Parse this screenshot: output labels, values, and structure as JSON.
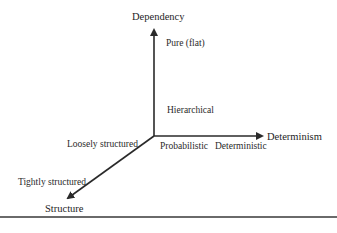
{
  "diagram": {
    "type": "3d-axes",
    "axes": {
      "vertical": {
        "title": "Dependency",
        "labels": [
          "Pure (flat)",
          "Hierarchical"
        ]
      },
      "horizontal": {
        "title": "Determinism",
        "labels": [
          "Probabilistic",
          "Deterministic"
        ]
      },
      "diagonal": {
        "title": "Structure",
        "labels": [
          "Loosely structured",
          "Tightly structured"
        ]
      }
    },
    "colors": {
      "axis": "#2a2a2a",
      "text": "#222222",
      "divider": "#6a6a6a",
      "background": "#ffffff"
    }
  }
}
